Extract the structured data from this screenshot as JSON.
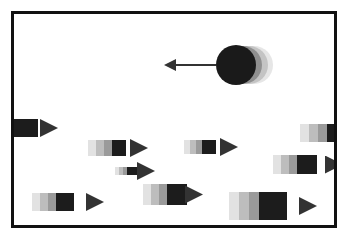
{
  "scene": {
    "title": "Moving objects with motion trails",
    "frame_color": "#111111",
    "background": "#ffffff",
    "player": {
      "shape": "circle",
      "color": "#1a1a1a",
      "direction": "left",
      "trail_shades": [
        "#e6e6e6",
        "#c4c4c4",
        "#8f8f8f"
      ]
    },
    "blocks": [
      {
        "id": 1,
        "direction": "right",
        "clipped": "left-edge"
      },
      {
        "id": 2,
        "direction": "right"
      },
      {
        "id": 3,
        "direction": "right"
      },
      {
        "id": 4,
        "direction": "right"
      },
      {
        "id": 5,
        "direction": "right",
        "clipped": "right-edge"
      },
      {
        "id": 6,
        "direction": "right",
        "clipped": "right-edge"
      },
      {
        "id": 7,
        "direction": "right"
      },
      {
        "id": 8,
        "direction": "right"
      },
      {
        "id": 9,
        "direction": "right"
      }
    ],
    "block_shades": [
      "#e2e2e2",
      "#bdbdbd",
      "#9a9a9a",
      "#1c1c1c"
    ],
    "arrow_color": "#333333"
  }
}
